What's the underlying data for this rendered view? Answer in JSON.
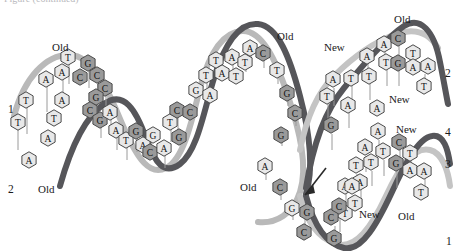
{
  "figure": {
    "type": "dna-replication-diagram",
    "title_fragment_cropped": "Figure  (continued)"
  },
  "colors": {
    "old_strand_dark": "#555558",
    "old_strand_light": "#b8b8b8",
    "new_strand_light": "#c9c9c9",
    "base_light_fill": "#e8e8e8",
    "base_dark_fill": "#9a9a9a",
    "base_outline": "#4a4a4a",
    "text": "#1a1a1a",
    "background": "#ffffff"
  },
  "labels": [
    {
      "id": "old-top-left",
      "text": "Old",
      "x": 52,
      "y": 42
    },
    {
      "id": "strand-1-left",
      "text": "1",
      "x": 8,
      "y": 104
    },
    {
      "id": "strand-2-left",
      "text": "2",
      "x": 8,
      "y": 184
    },
    {
      "id": "old-bottom-left",
      "text": "Old",
      "x": 38,
      "y": 184
    },
    {
      "id": "old-top-middle",
      "text": "Old",
      "x": 277,
      "y": 31
    },
    {
      "id": "old-bottom-middle",
      "text": "Old",
      "x": 240,
      "y": 182
    },
    {
      "id": "new-top-right",
      "text": "New",
      "x": 324,
      "y": 42
    },
    {
      "id": "old-top-right",
      "text": "Old",
      "x": 394,
      "y": 14
    },
    {
      "id": "strand-2-right",
      "text": "2",
      "x": 445,
      "y": 68
    },
    {
      "id": "new-mid-right",
      "text": "New",
      "x": 389,
      "y": 94
    },
    {
      "id": "new-lower-right",
      "text": "New",
      "x": 396,
      "y": 124
    },
    {
      "id": "strand-4-right",
      "text": "4",
      "x": 445,
      "y": 127
    },
    {
      "id": "strand-3-right",
      "text": "3",
      "x": 445,
      "y": 159
    },
    {
      "id": "new-bottom-mid",
      "text": "New",
      "x": 359,
      "y": 209
    },
    {
      "id": "old-bottom-right",
      "text": "Old",
      "x": 398,
      "y": 211
    },
    {
      "id": "strand-1-right",
      "text": "1",
      "x": 446,
      "y": 236
    }
  ],
  "bases": {
    "parent_strand_1_top": [
      {
        "base": "T",
        "x": 18,
        "y": 122,
        "shade": "light"
      },
      {
        "base": "T",
        "x": 26,
        "y": 100,
        "shade": "light"
      },
      {
        "base": "A",
        "x": 46,
        "y": 79,
        "shade": "light"
      },
      {
        "base": "A",
        "x": 62,
        "y": 72,
        "shade": "light"
      },
      {
        "base": "T",
        "x": 68,
        "y": 57,
        "shade": "light"
      },
      {
        "base": "C",
        "x": 80,
        "y": 77,
        "shade": "dark"
      },
      {
        "base": "G",
        "x": 88,
        "y": 63,
        "shade": "dark"
      },
      {
        "base": "C",
        "x": 97,
        "y": 75,
        "shade": "dark"
      },
      {
        "base": "C",
        "x": 105,
        "y": 88,
        "shade": "dark"
      },
      {
        "base": "G",
        "x": 96,
        "y": 97,
        "shade": "dark"
      },
      {
        "base": "C",
        "x": 90,
        "y": 110,
        "shade": "dark"
      },
      {
        "base": "G",
        "x": 100,
        "y": 120,
        "shade": "dark"
      },
      {
        "base": "A",
        "x": 110,
        "y": 112,
        "shade": "light"
      },
      {
        "base": "A",
        "x": 116,
        "y": 130,
        "shade": "light"
      },
      {
        "base": "T",
        "x": 126,
        "y": 140,
        "shade": "light"
      }
    ],
    "parent_strand_2_bottom": [
      {
        "base": "A",
        "x": 29,
        "y": 160,
        "shade": "light"
      },
      {
        "base": "A",
        "x": 48,
        "y": 138,
        "shade": "light"
      },
      {
        "base": "T",
        "x": 54,
        "y": 118,
        "shade": "light"
      },
      {
        "base": "A",
        "x": 62,
        "y": 100,
        "shade": "light"
      },
      {
        "base": "G",
        "x": 136,
        "y": 131,
        "shade": "dark"
      },
      {
        "base": "A",
        "x": 143,
        "y": 145,
        "shade": "light"
      },
      {
        "base": "G",
        "x": 153,
        "y": 135,
        "shade": "light"
      },
      {
        "base": "C",
        "x": 150,
        "y": 152,
        "shade": "dark"
      },
      {
        "base": "A",
        "x": 164,
        "y": 148,
        "shade": "light"
      },
      {
        "base": "T",
        "x": 170,
        "y": 122,
        "shade": "light"
      },
      {
        "base": "G",
        "x": 179,
        "y": 137,
        "shade": "dark"
      },
      {
        "base": "C",
        "x": 177,
        "y": 110,
        "shade": "dark"
      },
      {
        "base": "C",
        "x": 190,
        "y": 112,
        "shade": "dark"
      },
      {
        "base": "G",
        "x": 196,
        "y": 90,
        "shade": "light"
      },
      {
        "base": "A",
        "x": 210,
        "y": 95,
        "shade": "light"
      },
      {
        "base": "T",
        "x": 206,
        "y": 75,
        "shade": "light"
      },
      {
        "base": "A",
        "x": 222,
        "y": 73,
        "shade": "light"
      },
      {
        "base": "T",
        "x": 216,
        "y": 60,
        "shade": "light"
      },
      {
        "base": "A",
        "x": 232,
        "y": 57,
        "shade": "light"
      },
      {
        "base": "T",
        "x": 236,
        "y": 76,
        "shade": "light"
      },
      {
        "base": "T",
        "x": 245,
        "y": 62,
        "shade": "light"
      },
      {
        "base": "A",
        "x": 250,
        "y": 48,
        "shade": "light"
      },
      {
        "base": "C",
        "x": 263,
        "y": 53,
        "shade": "dark"
      },
      {
        "base": "T",
        "x": 277,
        "y": 70,
        "shade": "light"
      },
      {
        "base": "G",
        "x": 287,
        "y": 93,
        "shade": "dark"
      },
      {
        "base": "C",
        "x": 295,
        "y": 113,
        "shade": "dark"
      },
      {
        "base": "G",
        "x": 281,
        "y": 135,
        "shade": "dark"
      },
      {
        "base": "A",
        "x": 265,
        "y": 166,
        "shade": "light"
      },
      {
        "base": "C",
        "x": 280,
        "y": 187,
        "shade": "dark"
      },
      {
        "base": "G",
        "x": 292,
        "y": 208,
        "shade": "light"
      },
      {
        "base": "G",
        "x": 307,
        "y": 212,
        "shade": "dark"
      },
      {
        "base": "C",
        "x": 304,
        "y": 232,
        "shade": "dark"
      }
    ],
    "daughter_upper_new": [
      {
        "base": "T",
        "x": 327,
        "y": 96,
        "shade": "light"
      },
      {
        "base": "A",
        "x": 333,
        "y": 79,
        "shade": "light"
      },
      {
        "base": "A",
        "x": 348,
        "y": 105,
        "shade": "light"
      },
      {
        "base": "T",
        "x": 351,
        "y": 78,
        "shade": "light"
      },
      {
        "base": "A",
        "x": 367,
        "y": 56,
        "shade": "light"
      },
      {
        "base": "T",
        "x": 369,
        "y": 76,
        "shade": "light"
      },
      {
        "base": "A",
        "x": 384,
        "y": 44,
        "shade": "light"
      },
      {
        "base": "T",
        "x": 386,
        "y": 62,
        "shade": "light"
      }
    ],
    "daughter_upper_old": [
      {
        "base": "C",
        "x": 398,
        "y": 38,
        "shade": "dark"
      },
      {
        "base": "T",
        "x": 413,
        "y": 53,
        "shade": "light"
      },
      {
        "base": "G",
        "x": 398,
        "y": 63,
        "shade": "dark"
      },
      {
        "base": "A",
        "x": 413,
        "y": 67,
        "shade": "light"
      },
      {
        "base": "A",
        "x": 428,
        "y": 66,
        "shade": "light"
      },
      {
        "base": "T",
        "x": 424,
        "y": 86,
        "shade": "light"
      }
    ],
    "daughter_lower_new": [
      {
        "base": "G",
        "x": 331,
        "y": 125,
        "shade": "dark"
      },
      {
        "base": "A",
        "x": 378,
        "y": 131,
        "shade": "light"
      },
      {
        "base": "A",
        "x": 365,
        "y": 147,
        "shade": "light"
      },
      {
        "base": "T",
        "x": 383,
        "y": 151,
        "shade": "light"
      },
      {
        "base": "T",
        "x": 356,
        "y": 165,
        "shade": "light"
      },
      {
        "base": "T",
        "x": 371,
        "y": 162,
        "shade": "light"
      },
      {
        "base": "A",
        "x": 345,
        "y": 186,
        "shade": "light"
      },
      {
        "base": "A",
        "x": 360,
        "y": 182,
        "shade": "light"
      },
      {
        "base": "T",
        "x": 345,
        "y": 213,
        "shade": "light"
      },
      {
        "base": "C",
        "x": 331,
        "y": 217,
        "shade": "dark"
      },
      {
        "base": "G",
        "x": 334,
        "y": 238,
        "shade": "dark"
      }
    ],
    "daughter_lower_old": [
      {
        "base": "C",
        "x": 399,
        "y": 142,
        "shade": "dark"
      },
      {
        "base": "T",
        "x": 410,
        "y": 153,
        "shade": "light"
      },
      {
        "base": "G",
        "x": 396,
        "y": 163,
        "shade": "dark"
      },
      {
        "base": "A",
        "x": 410,
        "y": 170,
        "shade": "light"
      },
      {
        "base": "A",
        "x": 424,
        "y": 171,
        "shade": "light"
      },
      {
        "base": "T",
        "x": 421,
        "y": 192,
        "shade": "light"
      }
    ],
    "fork_lower_middle": [
      {
        "base": "A",
        "x": 377,
        "y": 108,
        "shade": "light"
      },
      {
        "base": "C",
        "x": 339,
        "y": 206,
        "shade": "dark"
      },
      {
        "base": "T",
        "x": 355,
        "y": 203,
        "shade": "light"
      },
      {
        "base": "A",
        "x": 352,
        "y": 186,
        "shade": "light"
      }
    ]
  },
  "arrow": {
    "id": "replication-direction-arrow",
    "x1": 326,
    "y1": 168,
    "x2": 302,
    "y2": 198
  }
}
